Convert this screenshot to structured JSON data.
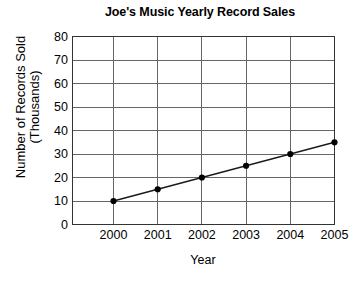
{
  "chart_data": {
    "type": "line",
    "title": "Joe's Music Yearly Record Sales",
    "xlabel": "Year",
    "ylabel": "Number of Records Sold",
    "ylabel_line2": "(Thousands)",
    "categories": [
      "2000",
      "2001",
      "2002",
      "2003",
      "2004",
      "2005"
    ],
    "x": [
      2000,
      2001,
      2002,
      2003,
      2004,
      2005
    ],
    "values": [
      10,
      15,
      20,
      25,
      30,
      35
    ],
    "series": [
      {
        "name": "Records Sold (Thousands)",
        "values": [
          10,
          15,
          20,
          25,
          30,
          35
        ]
      }
    ],
    "xtick_labels": [
      "2000",
      "2001",
      "2002",
      "2003",
      "2004",
      "2005"
    ],
    "ytick_labels": [
      "0",
      "10",
      "20",
      "30",
      "40",
      "50",
      "60",
      "70",
      "80"
    ],
    "ytick_values": [
      0,
      10,
      20,
      30,
      40,
      50,
      60,
      70,
      80
    ],
    "ylim": [
      0,
      80
    ],
    "xlim": [
      1999.5,
      2005.8
    ],
    "grid": true,
    "grid_axes": "both",
    "legend": false,
    "legend_position": "none",
    "marker": "filled-circle",
    "line_color": "#1a1a1a",
    "marker_color": "#000000",
    "grid_color": "#666666",
    "axis_color": "#333333",
    "background_color": "#ffffff",
    "annotations": []
  }
}
